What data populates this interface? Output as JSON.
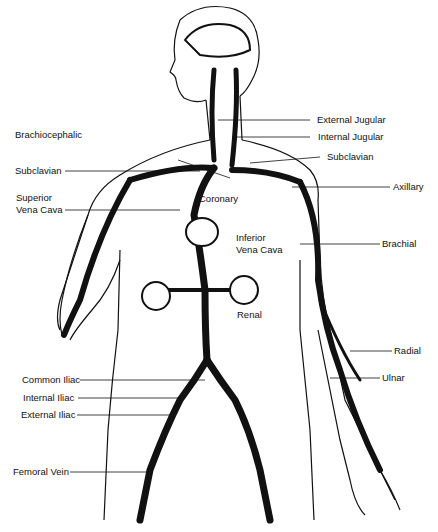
{
  "figure": {
    "labels": {
      "external_jugular": "External Jugular",
      "internal_jugular": "Internal Jugular",
      "brachiocephalic": "Brachiocephalic",
      "subclavian_left": "Subclavian",
      "subclavian_right": "Subclavian",
      "axillary": "Axillary",
      "superior_vena_cava_1": "Superior",
      "superior_vena_cava_2": "Vena Cava",
      "coronary": "Coronary",
      "inferior_vena_cava_1": "Inferior",
      "inferior_vena_cava_2": "Vena Cava",
      "brachial": "Brachial",
      "renal": "Renal",
      "radial": "Radial",
      "ulnar": "Ulnar",
      "common_iliac": "Common Iliac",
      "internal_iliac": "Internal Iliac",
      "external_iliac": "External Iliac",
      "femoral_vein": "Femoral Vein"
    },
    "colors": {
      "ink": "#111111",
      "background": "#ffffff"
    }
  }
}
